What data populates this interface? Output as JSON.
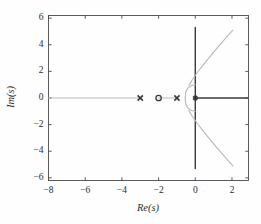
{
  "chart_data": {
    "type": "scatter",
    "title": "",
    "subtitle": "",
    "xlabel": "Re(s)",
    "ylabel": "Im(s)",
    "xlim": [
      -8,
      2.9
    ],
    "ylim": [
      -6.2,
      6.2
    ],
    "xticks": [
      -8,
      -6,
      -4,
      -2,
      0,
      2
    ],
    "xtick_labels": [
      "−8",
      "−6",
      "−4",
      "−2",
      "0",
      "2"
    ],
    "yticks": [
      -6,
      -4,
      -2,
      0,
      2,
      4,
      6
    ],
    "ytick_labels": [
      "−6",
      "−4",
      "−2",
      "0",
      "2",
      "4",
      "6"
    ],
    "grid": false,
    "legend": "none",
    "colors": {
      "locus_light": "#b9b9b9",
      "locus_dark": "#3a3a3a",
      "axis": "#4a4a4a",
      "text": "#2b2b2b"
    },
    "markers": {
      "poles": {
        "symbol": "x",
        "label": "open-loop pole",
        "points": [
          {
            "re": -3,
            "im": 0
          },
          {
            "re": -1,
            "im": 0
          },
          {
            "re": 0,
            "im": 0
          }
        ]
      },
      "zeros": {
        "symbol": "o",
        "label": "open-loop zero",
        "points": [
          {
            "re": -2,
            "im": 0
          }
        ]
      }
    },
    "branches": [
      {
        "name": "real-axis-branch-left",
        "style": "light",
        "comment": "real axis segment from far left to the pole at -3",
        "points": [
          [
            -8,
            0
          ],
          [
            -3,
            0
          ]
        ]
      },
      {
        "name": "real-axis-branch-inner",
        "style": "light",
        "comment": "real axis segment between the zero at -2 and the pole at -1",
        "points": [
          [
            -2,
            0
          ],
          [
            -1,
            0
          ]
        ]
      },
      {
        "name": "real-axis-branch-right",
        "style": "dark",
        "comment": "real axis branch running right from the origin pole",
        "points": [
          [
            0,
            0
          ],
          [
            2.85,
            0
          ]
        ]
      },
      {
        "name": "imag-axis-branch",
        "style": "dark",
        "comment": "vertical branch along the imaginary axis through the origin",
        "points": [
          [
            0,
            5.3
          ],
          [
            0,
            -5.3
          ]
        ]
      },
      {
        "name": "breakaway-arc-upper",
        "style": "light",
        "comment": "small circular arc bulging left of the origin, upper half",
        "points": [
          [
            0,
            1.0
          ],
          [
            -0.25,
            0.92
          ],
          [
            -0.42,
            0.72
          ],
          [
            -0.52,
            0.45
          ],
          [
            -0.55,
            0.0
          ]
        ]
      },
      {
        "name": "breakaway-arc-lower",
        "style": "light",
        "comment": "small circular arc bulging left of the origin, lower half",
        "points": [
          [
            -0.55,
            0.0
          ],
          [
            -0.52,
            -0.45
          ],
          [
            -0.42,
            -0.72
          ],
          [
            -0.25,
            -0.92
          ],
          [
            0,
            -1.0
          ]
        ]
      },
      {
        "name": "asymptote-upper",
        "style": "light",
        "comment": "branch departing upward to the right toward the asymptote",
        "points": [
          [
            -0.35,
            0.95
          ],
          [
            -0.2,
            1.3
          ],
          [
            0.1,
            1.9
          ],
          [
            0.5,
            2.6
          ],
          [
            1.0,
            3.45
          ],
          [
            1.5,
            4.25
          ],
          [
            2.05,
            5.1
          ]
        ]
      },
      {
        "name": "asymptote-lower",
        "style": "light",
        "comment": "branch departing downward to the right toward the asymptote",
        "points": [
          [
            -0.35,
            -0.95
          ],
          [
            -0.2,
            -1.3
          ],
          [
            0.1,
            -1.9
          ],
          [
            0.5,
            -2.6
          ],
          [
            1.0,
            -3.45
          ],
          [
            1.5,
            -4.25
          ],
          [
            2.05,
            -5.1
          ]
        ]
      }
    ]
  }
}
